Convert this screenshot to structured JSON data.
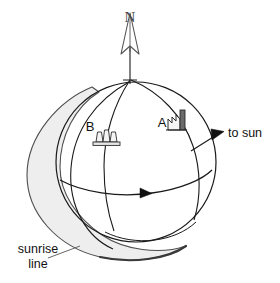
{
  "figure": {
    "kind": "earth-sunrise-terminator-diagram",
    "background_color": "#ffffff",
    "line_color": "#1a1a1a",
    "shade_fill": "#eeeeee",
    "shade_stroke": "#555555",
    "icon_fill": "#f2f2f2",
    "chimney_fill": "#6b6b6b"
  },
  "labels": {
    "north": "N",
    "site_a": "A",
    "site_b": "B",
    "to_sun": "to sun",
    "sunrise_line_1": "sunrise",
    "sunrise_line_2": "line"
  },
  "icons": {
    "north_arrow": "north-arrow-icon",
    "factory": "factory-icon",
    "power_plant": "cooling-towers-icon",
    "sun_direction_arrow": "arrowhead-icon",
    "rotation_arrow": "arrowhead-icon"
  },
  "geometry": {
    "sphere_center_x": 136,
    "sphere_center_y": 162,
    "sphere_radius": 80,
    "pole_x": 130,
    "pole_y": 79,
    "axis_top_y": 26
  }
}
